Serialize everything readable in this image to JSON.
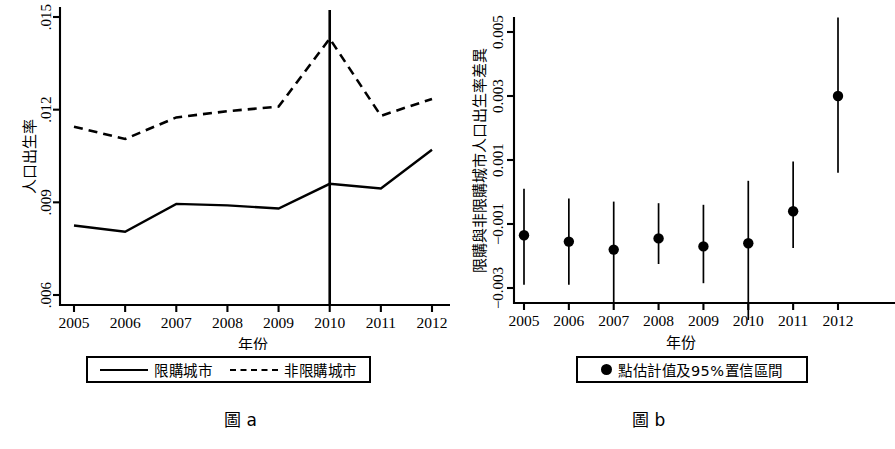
{
  "figure": {
    "panel_a_caption": "圖 a",
    "panel_b_caption": "圖 b"
  },
  "panel_a": {
    "ylabel": "人口出生率",
    "xlabel": "年份",
    "legend": [
      {
        "label": "限購城市",
        "style": "solid"
      },
      {
        "label": "非限購城市",
        "style": "dashed"
      }
    ],
    "yticks": [
      ".006",
      ".009",
      ".012",
      ".015"
    ],
    "xticks": [
      "2005",
      "2006",
      "2007",
      "2008",
      "2009",
      "2010",
      "2011",
      "2012"
    ]
  },
  "panel_b": {
    "ylabel": "限購與非限購城市人口出生率差異",
    "xlabel": "年份",
    "legend": [
      {
        "label": "點估計值及95%置信區間",
        "style": "dot"
      }
    ],
    "yticks": [
      "−0.003",
      "−0.001",
      "0.001",
      "0.003",
      "0.005"
    ],
    "xticks": [
      "2005",
      "2006",
      "2007",
      "2008",
      "2009",
      "2010",
      "2011",
      "2012"
    ]
  },
  "chart_data": [
    {
      "id": "panel-a",
      "type": "line",
      "title": "圖 a",
      "xlabel": "年份",
      "ylabel": "人口出生率",
      "categories": [
        "2005",
        "2006",
        "2007",
        "2008",
        "2009",
        "2010",
        "2011",
        "2012"
      ],
      "ylim": [
        0.006,
        0.015
      ],
      "ytick_values": [
        0.006,
        0.009,
        0.012,
        0.015
      ],
      "grid": false,
      "legend_position": "below-axes",
      "annotations": [
        {
          "type": "vline",
          "x": "2010",
          "label": "限購政策實施年",
          "style": "solid"
        }
      ],
      "series": [
        {
          "name": "限購城市",
          "style": "solid",
          "values": [
            0.00825,
            0.00805,
            0.00895,
            0.0089,
            0.0088,
            0.0096,
            0.00945,
            0.0107
          ]
        },
        {
          "name": "非限購城市",
          "style": "dashed",
          "values": [
            0.01145,
            0.01105,
            0.01175,
            0.01195,
            0.0121,
            0.0143,
            0.0118,
            0.01235
          ]
        }
      ]
    },
    {
      "id": "panel-b",
      "type": "scatter",
      "title": "圖 b",
      "xlabel": "年份",
      "ylabel": "限購與非限購城市人口出生率差異",
      "categories": [
        "2005",
        "2006",
        "2007",
        "2008",
        "2009",
        "2010",
        "2011",
        "2012"
      ],
      "ylim": [
        -0.004,
        0.0055
      ],
      "ytick_values": [
        -0.003,
        -0.001,
        0.001,
        0.003,
        0.005
      ],
      "grid": false,
      "legend_position": "below-axes",
      "series": [
        {
          "name": "點估計值及95%置信區間",
          "style": "point-with-errorbar",
          "values": [
            -0.00135,
            -0.00155,
            -0.0018,
            -0.00145,
            -0.0017,
            -0.0016,
            -0.0006,
            0.003
          ],
          "ci_low": [
            -0.0029,
            -0.0029,
            -0.00345,
            -0.00225,
            -0.00285,
            -0.004,
            -0.00175,
            0.0006
          ],
          "ci_high": [
            0.0001,
            -0.0002,
            -0.0003,
            -0.00035,
            -0.0004,
            0.00035,
            0.00095,
            0.00545
          ]
        }
      ]
    }
  ]
}
